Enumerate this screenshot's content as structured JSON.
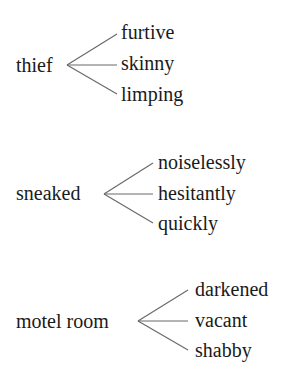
{
  "groups": [
    {
      "root": "thief",
      "children": [
        "furtive",
        "skinny",
        "limping"
      ]
    },
    {
      "root": "sneaked",
      "children": [
        "noiselessly",
        "hesitantly",
        "quickly"
      ]
    },
    {
      "root": "motel room",
      "children": [
        "darkened",
        "vacant",
        "shabby"
      ]
    }
  ]
}
